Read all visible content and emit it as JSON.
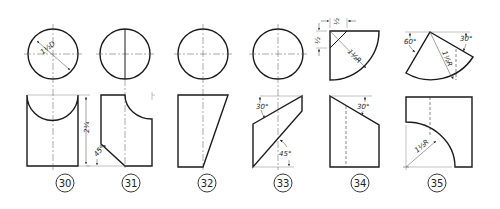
{
  "figures": [
    {
      "id": "30",
      "label": "30",
      "dims": {
        "diameter": "1 1/2 D",
        "height": "2 1/4"
      }
    },
    {
      "id": "31",
      "label": "31",
      "dims": {
        "angle": "45°"
      }
    },
    {
      "id": "32",
      "label": "32",
      "dims": {}
    },
    {
      "id": "33",
      "label": "33",
      "dims": {
        "angle_top": "30°",
        "angle_bottom": "45°"
      }
    },
    {
      "id": "34",
      "label": "34",
      "dims": {
        "offset_x": "1/2",
        "offset_y": "1/2",
        "radius": "1 1/2 R",
        "angle": "30°"
      }
    },
    {
      "id": "35",
      "label": "35",
      "dims": {
        "angle_left": "60°",
        "angle_right": "30°",
        "radius_top": "1 1/2 R",
        "radius_front": "1 1/2 R"
      }
    }
  ],
  "text": {
    "d30_dia": "1½D",
    "d30_h": "2¼",
    "d31_ang": "45°",
    "d33_a1": "30°",
    "d33_a2": "45°",
    "d34_x": "½",
    "d34_y": "½",
    "d34_r": "1½R",
    "d34_ang": "30°",
    "d35_a1": "60°",
    "d35_a2": "30°",
    "d35_r1": "1½R",
    "d35_r2": "1½R"
  }
}
